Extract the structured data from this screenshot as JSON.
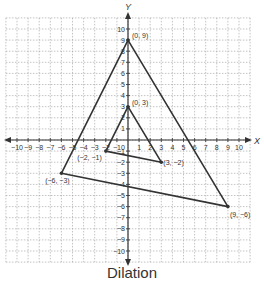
{
  "caption": "Dilation",
  "axes": {
    "x_label": "X",
    "y_label": "Y",
    "x_ticks": [
      -10,
      -9,
      -8,
      -7,
      -6,
      -5,
      -4,
      -3,
      -2,
      -1,
      1,
      2,
      3,
      4,
      5,
      6,
      7,
      8,
      9,
      10
    ],
    "y_ticks": [
      -10,
      -9,
      -8,
      -7,
      -6,
      -5,
      -4,
      -3,
      -2,
      -1,
      1,
      2,
      3,
      4,
      5,
      6,
      7,
      8,
      9,
      10
    ],
    "origin_label": "0"
  },
  "colors": {
    "grid": "#9a9a9a",
    "axis": "#333333",
    "shape": "#333333",
    "text": "#333333"
  },
  "chart_data": {
    "type": "scatter",
    "title": "Dilation",
    "xlabel": "X",
    "ylabel": "Y",
    "xlim": [
      -10,
      10
    ],
    "ylim": [
      -10,
      10
    ],
    "grid": true,
    "series": [
      {
        "name": "Original triangle",
        "points": [
          [
            0,
            3
          ],
          [
            -2,
            -1
          ],
          [
            3,
            -2
          ]
        ],
        "labels": [
          "(0, 3)",
          "(−2, −1)",
          "(3, −2)"
        ]
      },
      {
        "name": "Dilated triangle (scale factor 3)",
        "points": [
          [
            0,
            9
          ],
          [
            -6,
            -3
          ],
          [
            9,
            -6
          ]
        ],
        "labels": [
          "(0, 9)",
          "(−6, −3)",
          "(9, −6)"
        ]
      }
    ]
  }
}
